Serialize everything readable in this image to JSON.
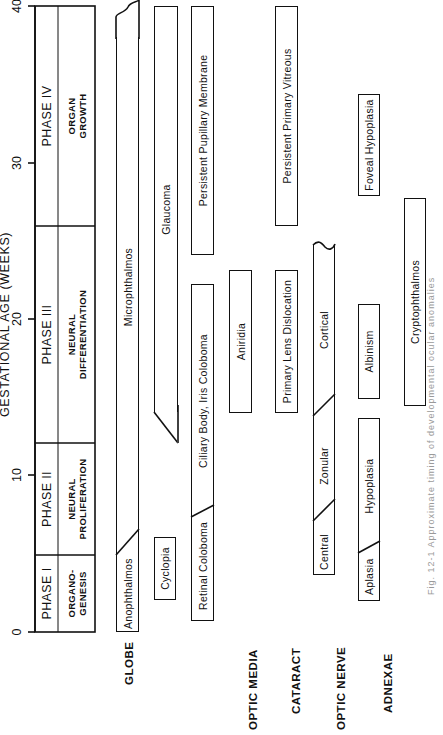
{
  "figure": {
    "orientation": "rotated 90 degrees counter-clockwise",
    "axis": {
      "title": "GESTATIONAL AGE (WEEKS)",
      "ticks": [
        "0",
        "10",
        "20",
        "30",
        "40"
      ],
      "range_weeks": [
        0,
        40
      ]
    },
    "phases": [
      {
        "name": "PHASE I",
        "description_line1": "ORGANO-",
        "description_line2": "GENESIS",
        "start_week": 0,
        "end_week": 5
      },
      {
        "name": "PHASE II",
        "description_line1": "NEURAL",
        "description_line2": "PROLIFERATION",
        "start_week": 5,
        "end_week": 12
      },
      {
        "name": "PHASE III",
        "description_line1": "NEURAL",
        "description_line2": "DIFFERENTIATION",
        "start_week": 12,
        "end_week": 26
      },
      {
        "name": "PHASE IV",
        "description_line1": "ORGAN",
        "description_line2": "GROWTH",
        "start_week": 26,
        "end_week": 40
      }
    ],
    "row_labels": {
      "globe": "GLOBE",
      "optic_media": "OPTIC MEDIA",
      "cataract": "CATARACT",
      "optic_nerve": "OPTIC NERVE",
      "adnexae": "ADNEXAE"
    },
    "bars": {
      "anophthalmos": {
        "label": "Anophthalmos",
        "start_week": 0,
        "end_week": 6.5
      },
      "microphthalmos": {
        "label": "Microphthalmos",
        "start_week": 5,
        "end_week": 39
      },
      "cyclopia": {
        "label": "Cyclopia",
        "start_week": 2,
        "end_week": 7
      },
      "glaucoma": {
        "label": "Glaucoma",
        "start_week": 13,
        "end_week": 40
      },
      "retinal_coloboma": {
        "label": "Retinal Coloboma",
        "start_week": 1,
        "end_week": 8
      },
      "ciliary_iris_coloboma": {
        "label": "Ciliary Body, Iris Coloboma",
        "start_week": 8,
        "end_week": 22
      },
      "persistent_pupillary_membrane": {
        "label": "Persistent Pupillary Membrane",
        "start_week": 24,
        "end_week": 40
      },
      "aniridia": {
        "label": "Aniridia",
        "start_week": 15,
        "end_week": 24
      },
      "primary_lens_dislocation": {
        "label": "Primary Lens Dislocation",
        "start_week": 15,
        "end_week": 24
      },
      "persistent_primary_vitreous": {
        "label": "Persistent Primary Vitreous",
        "start_week": 25,
        "end_week": 40
      },
      "cataract_central": {
        "label": "Central",
        "start_week": 4,
        "end_week": 7.5
      },
      "cataract_zonular": {
        "label": "Zonular",
        "start_week": 7.5,
        "end_week": 14
      },
      "cataract_cortical": {
        "label": "Cortical",
        "start_week": 14,
        "end_week": 25
      },
      "aplasia": {
        "label": "Aplasia",
        "start_week": 2,
        "end_week": 6
      },
      "hypoplasia": {
        "label": "Hypoplasia",
        "start_week": 6,
        "end_week": 15
      },
      "albinism": {
        "label": "Albinism",
        "start_week": 16,
        "end_week": 25
      },
      "foveal_hypoplasia": {
        "label": "Foveal Hypoplasia",
        "start_week": 28,
        "end_week": 35
      },
      "cryptophthalmos": {
        "label": "Cryptophthalmos",
        "start_week": 6,
        "end_week": 25
      }
    },
    "caption": "Fig. 12-1 Approximate timing of developmental ocular anomalies"
  }
}
